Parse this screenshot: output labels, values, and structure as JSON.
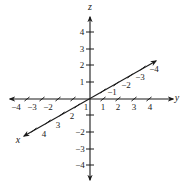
{
  "diagram": {
    "origin": [
      90,
      99
    ],
    "colors": {
      "axis": "#1a1a1a",
      "text": "#222222",
      "background": "#ffffff"
    },
    "axes": {
      "z": {
        "label": "z",
        "label_pos": [
          90,
          10
        ],
        "start": [
          90,
          180
        ],
        "end": [
          90,
          17
        ],
        "arrows": [
          "both"
        ],
        "ticks": [
          {
            "value": 4,
            "label": "4",
            "pos": [
              90,
              32
            ],
            "label_pos": [
              82,
              35
            ]
          },
          {
            "value": 3,
            "label": "3",
            "pos": [
              90,
              49
            ],
            "label_pos": [
              82,
              52
            ]
          },
          {
            "value": 2,
            "label": "2",
            "pos": [
              90,
              65
            ],
            "label_pos": [
              82,
              68
            ]
          },
          {
            "value": 1,
            "label": "1",
            "pos": [
              90,
              82
            ],
            "label_pos": [
              82,
              85
            ]
          },
          {
            "value": -1,
            "label": "",
            "pos": [
              90,
              115
            ],
            "label_pos": [
              82,
              118
            ]
          },
          {
            "value": -2,
            "label": "−2",
            "pos": [
              90,
              132
            ],
            "label_pos": [
              80,
              135
            ]
          },
          {
            "value": -3,
            "label": "−3",
            "pos": [
              90,
              149
            ],
            "label_pos": [
              80,
              152
            ]
          },
          {
            "value": -4,
            "label": "−4",
            "pos": [
              90,
              165
            ],
            "label_pos": [
              80,
              168
            ]
          }
        ]
      },
      "y": {
        "label": "y",
        "label_pos": [
          177,
          101
        ],
        "start": [
          10,
          99
        ],
        "end": [
          173,
          99
        ],
        "ticks": [
          {
            "value": -4,
            "label": "−4",
            "pos": [
              27,
              99
            ],
            "label_pos": [
              16,
              110
            ]
          },
          {
            "value": -3,
            "label": "−3",
            "pos": [
              42,
              99
            ],
            "label_pos": [
              32,
              110
            ]
          },
          {
            "value": -2,
            "label": "−2",
            "pos": [
              58,
              99
            ],
            "label_pos": [
              48,
              110
            ]
          },
          {
            "value": -1,
            "label": "",
            "pos": [
              73,
              99
            ],
            "label_pos": [
              64,
              110
            ]
          },
          {
            "value": 1,
            "label": "1",
            "pos": [
              103,
              99
            ],
            "label_pos": [
              103,
              110
            ]
          },
          {
            "value": 2,
            "label": "2",
            "pos": [
              118,
              99
            ],
            "label_pos": [
              118,
              110
            ]
          },
          {
            "value": 3,
            "label": "3",
            "pos": [
              134,
              99
            ],
            "label_pos": [
              134,
              110
            ]
          },
          {
            "value": 4,
            "label": "4",
            "pos": [
              149,
              99
            ],
            "label_pos": [
              150,
              110
            ]
          }
        ]
      },
      "x": {
        "label": "x",
        "label_pos": [
          18,
          143
        ],
        "start": [
          24,
          136
        ],
        "end": [
          156,
          61
        ],
        "ticks": [
          {
            "value": 4,
            "label": "4",
            "pos": [
              34,
              130
            ],
            "label_pos": [
              44,
              137
            ]
          },
          {
            "value": 3,
            "label": "3",
            "pos": [
              48,
              122
            ],
            "label_pos": [
              58,
              128
            ]
          },
          {
            "value": 2,
            "label": "2",
            "pos": [
              62,
              114
            ],
            "label_pos": [
              72,
              119
            ]
          },
          {
            "value": 1,
            "label": "1",
            "pos": [
              77,
              106
            ],
            "label_pos": [
              86,
              110
            ]
          },
          {
            "value": -1,
            "label": "−1",
            "pos": [
              103,
              91
            ],
            "label_pos": [
              112,
              95
            ]
          },
          {
            "value": -2,
            "label": "−2",
            "pos": [
              116,
              84
            ],
            "label_pos": [
              126,
              88
            ]
          },
          {
            "value": -3,
            "label": "−3",
            "pos": [
              130,
              76
            ],
            "label_pos": [
              140,
              80
            ]
          },
          {
            "value": -4,
            "label": "−4",
            "pos": [
              143,
              68
            ],
            "label_pos": [
              154,
              72
            ]
          }
        ]
      }
    }
  }
}
